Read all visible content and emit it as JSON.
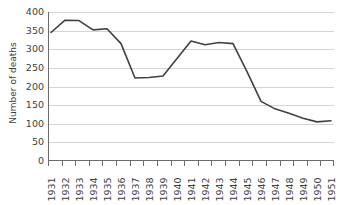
{
  "chart_data": {
    "type": "line",
    "title": "",
    "xlabel": "",
    "ylabel": "Number of deaths",
    "categories": [
      "1931",
      "1932",
      "1933",
      "1934",
      "1935",
      "1936",
      "1937",
      "1938",
      "1939",
      "1940",
      "1941",
      "1942",
      "1943",
      "1944",
      "1945",
      "1946",
      "1947",
      "1948",
      "1949",
      "1950",
      "1951"
    ],
    "values": [
      345,
      378,
      377,
      352,
      355,
      315,
      223,
      224,
      228,
      275,
      322,
      312,
      318,
      315,
      240,
      160,
      140,
      128,
      115,
      105,
      108
    ],
    "series": [
      {
        "name": "Number of deaths",
        "values": [
          345,
          378,
          377,
          352,
          355,
          315,
          223,
          224,
          228,
          275,
          322,
          312,
          318,
          315,
          240,
          160,
          140,
          128,
          115,
          105,
          108
        ]
      }
    ],
    "ylim": [
      0,
      400
    ],
    "ytick_values": [
      0,
      50,
      100,
      150,
      200,
      250,
      300,
      350,
      400
    ],
    "ytick_labels": [
      "0",
      "50",
      "100",
      "150",
      "200",
      "250",
      "300",
      "350",
      "400"
    ],
    "grid": true,
    "grid_axis": "y",
    "legend": false,
    "legend_position": "none",
    "line_color": "#404040",
    "axis_color": "#6b6b6b",
    "grid_color": "#d4d4d4",
    "background": "#ffffff",
    "xtick_rotation": -90
  }
}
